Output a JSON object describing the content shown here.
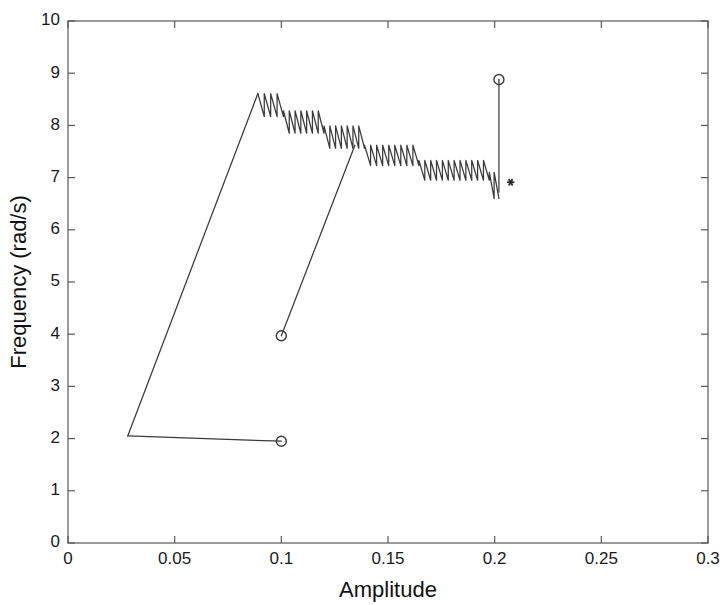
{
  "figure": {
    "background_color": "#ffffff",
    "line_color": "#3a3a3a",
    "axis_color": "#595959"
  },
  "axes": {
    "x_title": "Amplitude",
    "y_title": "Frequency (rad/s)",
    "x_ticks": [
      "0",
      "0.05",
      "0.1",
      "0.15",
      "0.2",
      "0.25",
      "0.3"
    ],
    "y_ticks": [
      "0",
      "1",
      "2",
      "3",
      "4",
      "5",
      "6",
      "7",
      "8",
      "9",
      "10"
    ]
  },
  "chart_data": {
    "type": "line",
    "title": "",
    "xlabel": "Amplitude",
    "ylabel": "Frequency (rad/s)",
    "xlim": [
      0,
      0.3
    ],
    "ylim": [
      0,
      10
    ],
    "xticks": [
      0,
      0.05,
      0.1,
      0.15,
      0.2,
      0.25,
      0.3
    ],
    "yticks": [
      0,
      1,
      2,
      3,
      4,
      5,
      6,
      7,
      8,
      9,
      10
    ],
    "grid": false,
    "legend": false,
    "series": [
      {
        "name": "branch-1-lower-horizontal",
        "style": "solid-line",
        "points": [
          [
            0.1,
            1.95
          ],
          [
            0.028,
            2.05
          ]
        ]
      },
      {
        "name": "branch-1-ascending-ramp",
        "style": "solid-line",
        "points": [
          [
            0.028,
            2.05
          ],
          [
            0.089,
            8.61
          ]
        ]
      },
      {
        "name": "branch-1-sawtooth-plateaus",
        "style": "solid-line-sawtooth",
        "description": "descending staircase of sawtooth oscillation bands from ~8.6 down to ~6.6 rad/s",
        "plateaus": [
          {
            "x_start": 0.089,
            "x_end": 0.101,
            "top": 8.61,
            "bottom": 8.17,
            "teeth": 4
          },
          {
            "x_start": 0.101,
            "x_end": 0.12,
            "top": 8.28,
            "bottom": 7.85,
            "teeth": 7
          },
          {
            "x_start": 0.12,
            "x_end": 0.139,
            "top": 7.99,
            "bottom": 7.56,
            "teeth": 7
          },
          {
            "x_start": 0.139,
            "x_end": 0.1645,
            "top": 7.62,
            "bottom": 7.23,
            "teeth": 9
          },
          {
            "x_start": 0.1645,
            "x_end": 0.1975,
            "top": 7.33,
            "bottom": 6.95,
            "teeth": 12
          },
          {
            "x_start": 0.1975,
            "x_end": 0.202,
            "top": 7.1,
            "bottom": 6.6,
            "teeth": 2
          }
        ]
      },
      {
        "name": "branch-2-ascending-ramp",
        "style": "solid-line",
        "points": [
          [
            0.1,
            3.97
          ],
          [
            0.1345,
            7.62
          ]
        ]
      },
      {
        "name": "vertical-jump",
        "style": "solid-line",
        "points": [
          [
            0.202,
            6.72
          ],
          [
            0.202,
            8.88
          ]
        ]
      }
    ],
    "markers": [
      {
        "name": "circle-lower-left",
        "symbol": "o",
        "x": 0.1,
        "y": 1.95
      },
      {
        "name": "circle-mid",
        "symbol": "o",
        "x": 0.1,
        "y": 3.97
      },
      {
        "name": "circle-upper-right",
        "symbol": "o",
        "x": 0.202,
        "y": 8.88
      },
      {
        "name": "asterisk-right",
        "symbol": "*",
        "x": 0.2075,
        "y": 6.91
      }
    ]
  }
}
